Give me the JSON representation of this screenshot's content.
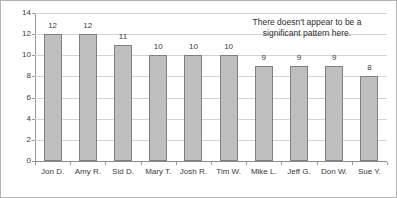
{
  "chart_data": {
    "type": "bar",
    "title": "",
    "xlabel": "",
    "ylabel": "",
    "categories": [
      "Jon D.",
      "Amy R.",
      "Sid D.",
      "Mary T.",
      "Josh R.",
      "Tim W.",
      "Mike L.",
      "Jeff G.",
      "Don W.",
      "Sue Y."
    ],
    "values": [
      12,
      12,
      11,
      10,
      10,
      10,
      9,
      9,
      9,
      8
    ],
    "ylim": [
      0,
      14
    ],
    "ytick_labels": [
      "0",
      "2",
      "4",
      "6",
      "8",
      "10",
      "12",
      "14"
    ],
    "ytick_values": [
      0,
      2,
      4,
      6,
      8,
      10,
      12,
      14
    ],
    "grid": true,
    "grid_orientation": "horizontal",
    "legend": false,
    "data_labels": true,
    "annotations": [
      {
        "name": "pattern-note",
        "line1": "There doesn't appear to be a",
        "line2": "significant pattern here."
      }
    ],
    "colors": {
      "bar_fill": "#bfbfbf",
      "bar_border": "#808080",
      "gridline": "#d2d2d2",
      "axis": "#8c8c8c",
      "frame_border": "#b4b4b4",
      "text": "#3a3a3a",
      "background": "#ffffff"
    }
  }
}
